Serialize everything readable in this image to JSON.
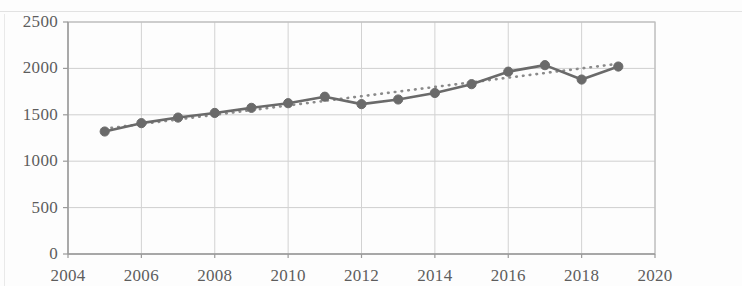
{
  "chart_data": {
    "type": "line",
    "title": "",
    "subtitle": "",
    "xlabel": "",
    "ylabel": "",
    "xlim": [
      2004,
      2020
    ],
    "ylim": [
      0,
      2500
    ],
    "grid": true,
    "legend": "none",
    "x_ticks": [
      "2004",
      "2006",
      "2008",
      "2010",
      "2012",
      "2014",
      "2016",
      "2018",
      "2020"
    ],
    "y_ticks": [
      "0",
      "500",
      "1000",
      "1500",
      "2000",
      "2500"
    ],
    "x": [
      2005,
      2006,
      2007,
      2008,
      2009,
      2010,
      2011,
      2012,
      2013,
      2014,
      2015,
      2016,
      2017,
      2018,
      2019
    ],
    "series": [
      {
        "name": "data",
        "style": "solid-line-with-round-markers",
        "color": "#6b6b6b",
        "values": [
          1320,
          1410,
          1470,
          1520,
          1575,
          1625,
          1695,
          1615,
          1665,
          1735,
          1830,
          1965,
          2035,
          1880,
          2020
        ]
      },
      {
        "name": "trendline",
        "style": "dotted",
        "color": "#8a8a8a",
        "values": [
          1350,
          1400,
          1450,
          1500,
          1550,
          1600,
          1650,
          1700,
          1750,
          1800,
          1850,
          1900,
          1950,
          2000,
          2050
        ]
      }
    ]
  },
  "axis": {
    "y_min": 0,
    "y_max": 2500,
    "x_min": 2004,
    "x_max": 2020
  }
}
